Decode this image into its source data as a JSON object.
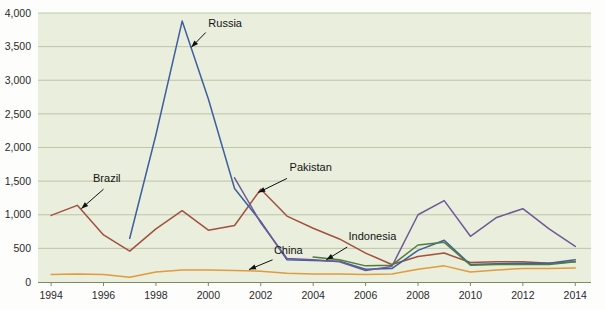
{
  "chart_data": {
    "type": "line",
    "title": "",
    "subtitle": "",
    "xlabel": "",
    "ylabel": "",
    "xlim": [
      1993.5,
      2014.6
    ],
    "ylim": [
      0,
      4000
    ],
    "grid": true,
    "legend_position": "inline-annotations",
    "y_ticks": [
      0,
      500,
      1000,
      1500,
      2000,
      2500,
      3000,
      3500,
      4000
    ],
    "y_tick_labels": [
      "0",
      "500",
      "1,000",
      "1,500",
      "2,000",
      "2,500",
      "3,000",
      "3,500",
      "4,000"
    ],
    "x_ticks": [
      1994,
      1996,
      1998,
      2000,
      2002,
      2004,
      2006,
      2008,
      2010,
      2012,
      2014
    ],
    "x_tick_labels": [
      "1994",
      "1996",
      "1998",
      "2000",
      "2002",
      "2004",
      "2006",
      "2008",
      "2010",
      "2012",
      "2014"
    ],
    "x": [
      1994,
      1995,
      1996,
      1997,
      1998,
      1999,
      2000,
      2001,
      2002,
      2003,
      2004,
      2005,
      2006,
      2007,
      2008,
      2009,
      2010,
      2011,
      2012,
      2013,
      2014
    ],
    "series": [
      {
        "name": "Brazil",
        "color": "#a2503f",
        "label": "Brazil",
        "label_x": 1995.6,
        "label_y": 1480,
        "leader_from": [
          1996.0,
          1380
        ],
        "leader_to": [
          1995.15,
          1090
        ],
        "x": [
          1994,
          1995,
          1996,
          1997,
          1998,
          1999,
          2000,
          2001,
          2002,
          2003,
          2004,
          2005,
          2006,
          2007,
          2008,
          2009,
          2010,
          2011,
          2012,
          2013,
          2014
        ],
        "values": [
          990,
          1140,
          700,
          460,
          790,
          1060,
          770,
          840,
          1380,
          980,
          800,
          640,
          430,
          260,
          380,
          430,
          290,
          300,
          300,
          280,
          300
        ]
      },
      {
        "name": "Russia",
        "color": "#3e5f9e",
        "label": "Russia",
        "label_x": 2000.0,
        "label_y": 3790,
        "leader_from": [
          1999.9,
          3710
        ],
        "leader_to": [
          1999.35,
          3490
        ],
        "x": [
          1997,
          1998,
          1999,
          2000,
          2001,
          2002,
          2003,
          2004,
          2005,
          2006,
          2007,
          2008,
          2009,
          2010,
          2011,
          2012,
          2013,
          2014
        ],
        "values": [
          650,
          2190,
          3880,
          2720,
          1390,
          900,
          330,
          320,
          310,
          190,
          200,
          470,
          620,
          260,
          270,
          280,
          280,
          330
        ]
      },
      {
        "name": "Pakistan",
        "color": "#6e5a96",
        "label": "Pakistan",
        "label_x": 2003.1,
        "label_y": 1650,
        "leader_from": [
          2003.0,
          1540
        ],
        "leader_to": [
          2001.9,
          1330
        ],
        "x": [
          2001,
          2002,
          2003,
          2004,
          2005,
          2006,
          2007,
          2008,
          2009,
          2010,
          2011,
          2012,
          2013,
          2014
        ],
        "values": [
          1550,
          880,
          350,
          330,
          300,
          170,
          230,
          1000,
          1210,
          680,
          960,
          1090,
          790,
          530
        ]
      },
      {
        "name": "Indonesia",
        "color": "#4e7d3e",
        "label": "Indonesia",
        "label_x": 2005.35,
        "label_y": 630,
        "leader_from": [
          2005.3,
          520
        ],
        "leader_to": [
          2004.5,
          330
        ],
        "x": [
          2004,
          2005,
          2006,
          2007,
          2008,
          2009,
          2010,
          2011,
          2012,
          2013,
          2014
        ],
        "values": [
          370,
          330,
          240,
          250,
          550,
          590,
          250,
          260,
          260,
          260,
          300
        ]
      },
      {
        "name": "China",
        "color": "#e09b3c",
        "label": "China",
        "label_x": 2002.5,
        "label_y": 420,
        "leader_from": [
          2002.45,
          330
        ],
        "leader_to": [
          2001.55,
          185
        ],
        "x": [
          1994,
          1995,
          1996,
          1997,
          1998,
          1999,
          2000,
          2001,
          2002,
          2003,
          2004,
          2005,
          2006,
          2007,
          2008,
          2009,
          2010,
          2011,
          2012,
          2013,
          2014
        ],
        "values": [
          110,
          120,
          110,
          70,
          150,
          180,
          180,
          170,
          160,
          130,
          120,
          120,
          110,
          120,
          190,
          240,
          150,
          180,
          200,
          200,
          210
        ]
      }
    ]
  },
  "geometry": {
    "plot_left": 38,
    "plot_right": 591,
    "plot_top": 13,
    "plot_bottom": 282
  }
}
